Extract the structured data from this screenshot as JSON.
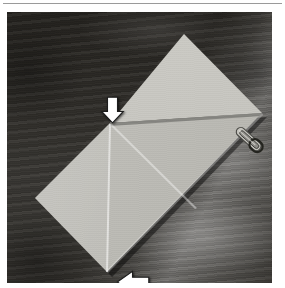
{
  "page": {
    "kind": "origami-instruction-photograph",
    "background_color": "#ffffff",
    "top_rule_color": "#9a9a9a"
  },
  "photo": {
    "frame": {
      "left": 7,
      "top": 12,
      "width": 265,
      "height": 271
    },
    "background": {
      "name": "wooden-table-surface",
      "material": "dark stained wood with horizontal grain",
      "dark_tone": "#2b2926",
      "mid_tone": "#3a3834",
      "highlight_tone": "#6d6d68",
      "highlight_location": "lower-right quadrant"
    },
    "subject": {
      "name": "folded-paper-sheet",
      "material": "light gray origami paper",
      "orientation": "square rotated about 45 degrees (diamond)",
      "upper_panel_color": "#c9c8c2",
      "lower_panel_color": "#bdbcb6",
      "fold_edge_color": "#5a5a55",
      "corners": {
        "top": [
          177,
          22
        ],
        "right": [
          255,
          101
        ],
        "bottom": [
          100,
          260
        ],
        "left": [
          28,
          186
        ]
      },
      "creases": [
        {
          "name": "horizontal-fold-edge",
          "from": [
            103,
            111
          ],
          "to": [
            255,
            101
          ]
        },
        {
          "name": "vertical-center-crease",
          "from": [
            103,
            111
          ],
          "to": [
            100,
            260
          ]
        },
        {
          "name": "diagonal-crease",
          "from": [
            103,
            111
          ],
          "to": [
            189,
            196
          ]
        }
      ]
    },
    "accessory": {
      "name": "paper-clip",
      "material": "metal",
      "color": "#b9b8b2",
      "position": [
        224,
        112
      ],
      "angle_degrees": 42
    },
    "annotations": [
      {
        "name": "arrow-down",
        "shape": "block-arrow",
        "direction": "down",
        "fill": "#ffffff",
        "outline": "#1d1d1d",
        "position": [
          93,
          84
        ],
        "size": [
          25,
          28
        ],
        "points_at": "left fold corner of the sheet"
      },
      {
        "name": "arrow-left",
        "shape": "block-arrow",
        "direction": "left",
        "fill": "#ffffff",
        "outline": "#1d1d1d",
        "position": [
          109,
          258
        ],
        "size": [
          34,
          24
        ],
        "points_at": "bottom tip of the sheet"
      }
    ]
  }
}
